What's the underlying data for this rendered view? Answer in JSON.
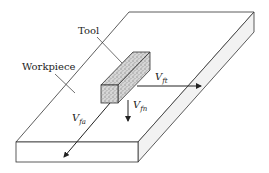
{
  "labels": {
    "tool": "Tool",
    "workpiece": "Workpiece"
  },
  "forces": {
    "ft": {
      "symbol": "V",
      "subscript": "ft",
      "direction": "right"
    },
    "fn": {
      "symbol": "V",
      "subscript": "fn",
      "direction": "down"
    },
    "fa": {
      "symbol": "V",
      "subscript": "fa",
      "direction": "front-left"
    }
  },
  "colors": {
    "line": "#222222",
    "slab_side": "#f2f2f2",
    "tool_fill": "#bdbdbd"
  }
}
